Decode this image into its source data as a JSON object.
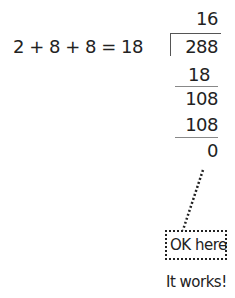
{
  "equation": {
    "expression": "2 + 8 + 8 = 18",
    "divisor": "18"
  },
  "long_division": {
    "quotient": "16",
    "dividend": "288",
    "steps": [
      "18",
      "108",
      "108",
      "0"
    ]
  },
  "annotation": {
    "box_label": "OK here",
    "caption": "It works!"
  }
}
